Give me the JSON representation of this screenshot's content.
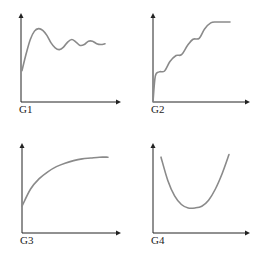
{
  "chart_data": [
    {
      "type": "line",
      "label": "G1",
      "description": "Rises from mid-low start to a peak, then damped oscillations settling",
      "shape": "damped-oscillation",
      "x": [
        0,
        0.05,
        0.1,
        0.15,
        0.2,
        0.25,
        0.3,
        0.35,
        0.4,
        0.45,
        0.5,
        0.55,
        0.6,
        0.65,
        0.7,
        0.75,
        0.8,
        0.85,
        0.9,
        0.95,
        1.0
      ],
      "y": [
        0.35,
        0.55,
        0.72,
        0.82,
        0.85,
        0.83,
        0.77,
        0.68,
        0.62,
        0.6,
        0.63,
        0.69,
        0.72,
        0.69,
        0.65,
        0.66,
        0.7,
        0.7,
        0.67,
        0.66,
        0.67
      ],
      "xlabel": "",
      "ylabel": "",
      "axis_arrows": true,
      "grid": false
    },
    {
      "type": "line",
      "label": "G2",
      "description": "Staircase-like rising wavy curve starting at origin",
      "shape": "staircase-rise",
      "x": [
        0,
        0.03,
        0.08,
        0.15,
        0.22,
        0.3,
        0.37,
        0.45,
        0.52,
        0.6,
        0.67,
        0.75,
        0.82,
        0.9,
        1.0
      ],
      "y": [
        0.0,
        0.3,
        0.35,
        0.36,
        0.47,
        0.54,
        0.55,
        0.66,
        0.73,
        0.74,
        0.85,
        0.92,
        0.93,
        0.93,
        0.93
      ],
      "xlabel": "",
      "ylabel": "",
      "axis_arrows": true,
      "grid": false
    },
    {
      "type": "line",
      "label": "G3",
      "description": "Concave increasing curve approaching an asymptote",
      "shape": "saturating-growth",
      "x": [
        0,
        0.1,
        0.2,
        0.3,
        0.4,
        0.5,
        0.6,
        0.7,
        0.8,
        0.9,
        1.0
      ],
      "y": [
        0.3,
        0.5,
        0.62,
        0.7,
        0.76,
        0.8,
        0.83,
        0.85,
        0.86,
        0.87,
        0.87
      ],
      "xlabel": "",
      "ylabel": "",
      "axis_arrows": true,
      "grid": false
    },
    {
      "type": "line",
      "label": "G4",
      "description": "U-shaped curve with a minimum in the middle",
      "shape": "u-shaped",
      "x": [
        0,
        0.1,
        0.2,
        0.3,
        0.4,
        0.5,
        0.6,
        0.7,
        0.8,
        0.9,
        1.0
      ],
      "y": [
        0.87,
        0.6,
        0.42,
        0.32,
        0.28,
        0.28,
        0.3,
        0.37,
        0.5,
        0.68,
        0.9
      ],
      "xlabel": "",
      "ylabel": "",
      "axis_arrows": true,
      "grid": false
    }
  ],
  "colors": {
    "axis": "#222222",
    "curve": "#8a8a8a",
    "background": "#ffffff"
  }
}
